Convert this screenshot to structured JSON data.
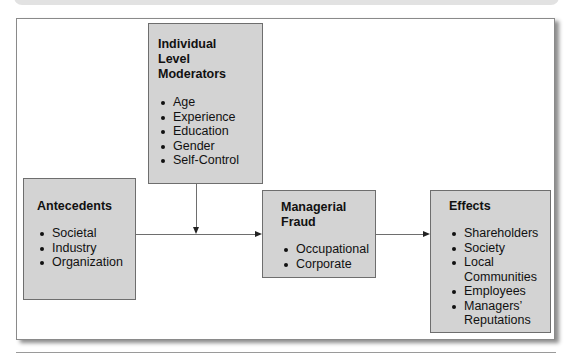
{
  "diagram": {
    "moderators": {
      "title_lines": [
        "Individual",
        "Level",
        "Moderators"
      ],
      "items": [
        "Age",
        "Experience",
        "Education",
        "Gender",
        "Self-Control"
      ]
    },
    "antecedents": {
      "title": "Antecedents",
      "items": [
        "Societal",
        "Industry",
        "Organization"
      ]
    },
    "fraud": {
      "title_lines": [
        "Managerial",
        "Fraud"
      ],
      "items": [
        "Occupational",
        "Corporate"
      ]
    },
    "effects": {
      "title": "Effects",
      "items": [
        {
          "lines": [
            "Shareholders"
          ]
        },
        {
          "lines": [
            "Society"
          ]
        },
        {
          "lines": [
            "Local",
            "Communities"
          ]
        },
        {
          "lines": [
            "Employees"
          ]
        },
        {
          "lines": [
            "Managers’",
            "Reputations"
          ]
        }
      ]
    },
    "connections": [
      {
        "from": "antecedents",
        "to": "fraud"
      },
      {
        "from": "moderators",
        "to": "antecedents-fraud-link"
      },
      {
        "from": "fraud",
        "to": "effects"
      }
    ]
  }
}
